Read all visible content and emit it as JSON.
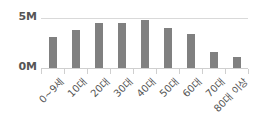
{
  "chart_data": {
    "type": "bar",
    "title": "",
    "xlabel": "",
    "ylabel": "",
    "categories": [
      "0~9세",
      "10대",
      "20대",
      "30대",
      "40대",
      "50대",
      "60대",
      "70대",
      "80대 이상"
    ],
    "values": [
      3.1,
      3.8,
      4.5,
      4.5,
      4.8,
      4.0,
      3.4,
      1.6,
      1.1
    ],
    "unit": "M",
    "ylim": [
      0,
      5
    ],
    "yticks": [
      {
        "value": 0,
        "label": "0M"
      },
      {
        "value": 5,
        "label": "5M"
      }
    ],
    "grid": true,
    "legend": "none",
    "colors": {
      "bar": "#808080",
      "grid": "#d9d9d9",
      "text": "#555555"
    }
  }
}
